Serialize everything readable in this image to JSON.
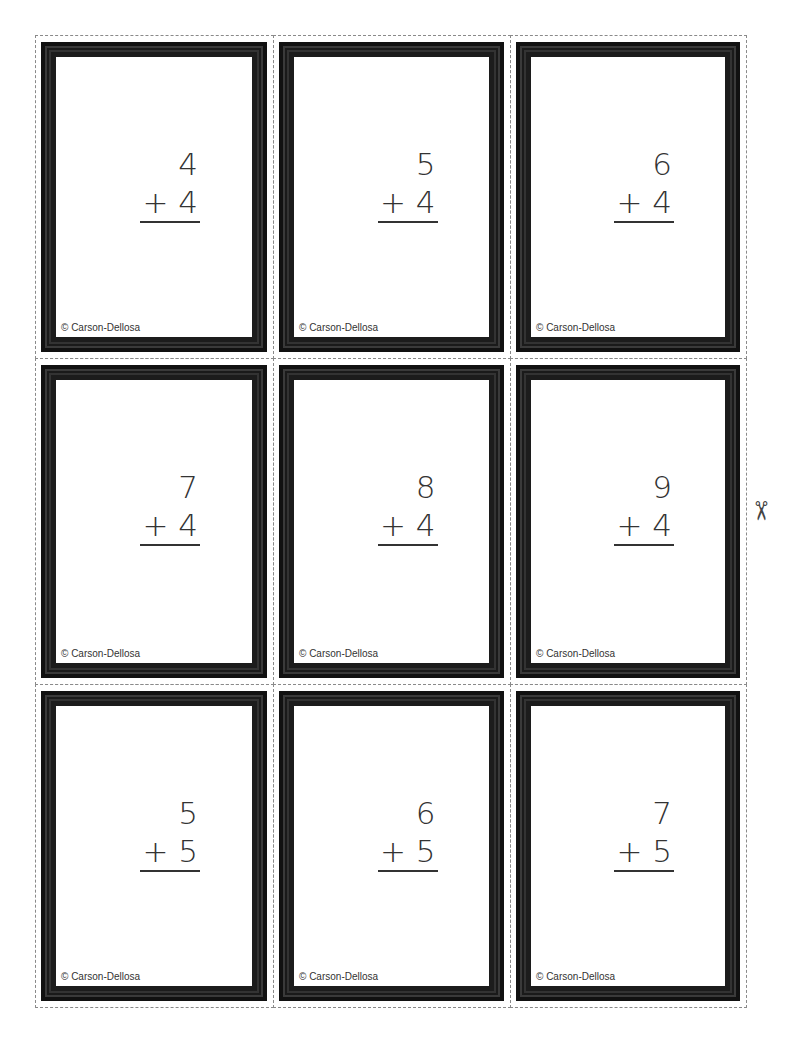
{
  "page": {
    "copyright": "© Carson-Dellosa",
    "scissors_icon": "✂",
    "cards": [
      {
        "top": "4",
        "bottom": "+ 4"
      },
      {
        "top": "5",
        "bottom": "+ 4"
      },
      {
        "top": "6",
        "bottom": "+ 4"
      },
      {
        "top": "7",
        "bottom": "+ 4"
      },
      {
        "top": "8",
        "bottom": "+ 4"
      },
      {
        "top": "9",
        "bottom": "+ 4"
      },
      {
        "top": "5",
        "bottom": "+ 5"
      },
      {
        "top": "6",
        "bottom": "+ 5"
      },
      {
        "top": "7",
        "bottom": "+ 5"
      }
    ]
  }
}
